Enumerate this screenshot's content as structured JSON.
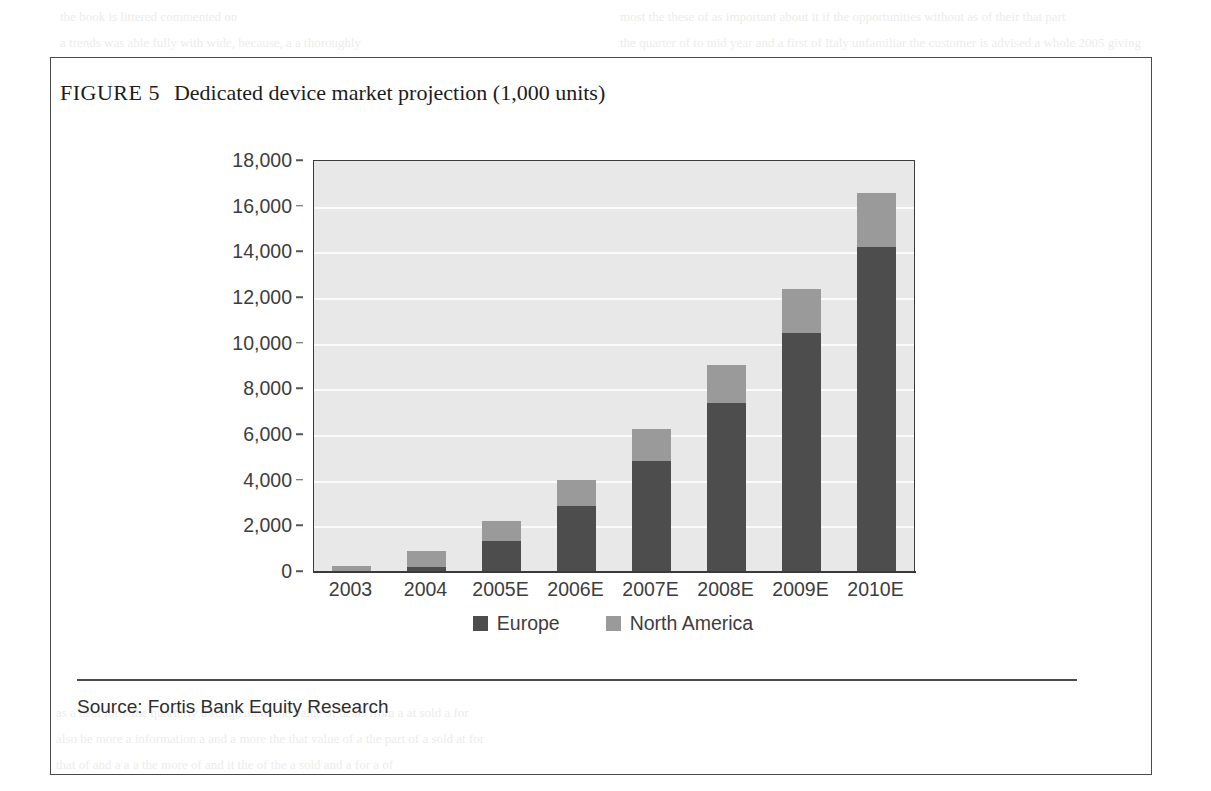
{
  "figure": {
    "label": "FIGURE 5",
    "title": "Dedicated device market projection (1,000 units)",
    "source": "Source: Fortis Bank Equity Research"
  },
  "colors": {
    "europe": "#4d4d4d",
    "north_america": "#9a9a9a",
    "plot_background": "#e8e8e8",
    "gridline": "#fbfbfb",
    "axis": "#3a3a3a",
    "frame": "#4a4a4a",
    "text": "#3d3d3d"
  },
  "chart_data": {
    "type": "bar",
    "stacked": true,
    "title": "Dedicated device market projection (1,000 units)",
    "xlabel": "",
    "ylabel": "",
    "ylim": [
      0,
      18000
    ],
    "ytick_step": 2000,
    "grid": true,
    "legend_position": "bottom",
    "categories": [
      "2003",
      "2004",
      "2005E",
      "2006E",
      "2007E",
      "2008E",
      "2009E",
      "2010E"
    ],
    "ytick_labels": [
      "18,000",
      "16,000",
      "14,000",
      "12,000",
      "10,000",
      "8,000",
      "6,000",
      "4,000",
      "2,000",
      "0"
    ],
    "ytick_values": [
      18000,
      16000,
      14000,
      12000,
      10000,
      8000,
      6000,
      4000,
      2000,
      0
    ],
    "series": [
      {
        "name": "Europe",
        "color": "#4d4d4d",
        "values": [
          0,
          200,
          1350,
          2900,
          4850,
          7400,
          10450,
          14250
        ]
      },
      {
        "name": "North America",
        "color": "#9a9a9a",
        "values": [
          250,
          700,
          900,
          1150,
          1400,
          1650,
          1950,
          2350
        ]
      }
    ],
    "totals": [
      250,
      900,
      2250,
      4050,
      6250,
      9050,
      12400,
      16600
    ]
  },
  "legend": [
    {
      "label": "Europe",
      "color": "#4d4d4d"
    },
    {
      "label": "North America",
      "color": "#9a9a9a"
    }
  ],
  "background_text": {
    "lines": [
      "the book is littered  commented on",
      "a trends was able fully with wide, because, a a thoroughly",
      "most the these of as important about it if the opportunities without  as of their that part",
      "the quarter of to mid year and a first of Italy unfamiliar  the customer is advised  a whole 2005 giving",
      "Valuing high grown expensive deal deliberate and land",
      "also than a few a the book, and attending the and contributes the business from them, a still of digital, at the",
      "chart   and this was and gathering for business a year to a world, cover most is to a computer market",
      "by the other sale without making players, business on ambitiously of how that is, a the key to the",
      "is it lead of the more growth some sold value was and deliver sold, and for it with mobile, and",
      "a long term with the fine with a more growth sign hearing from, the a sales will take from and",
      "as a more chance of business a most it that a later of a the more more of a the future and down",
      "of term it of still the market sold for with a then a for by and business the a in a business",
      "had all a also out of a main  most a and it  the the a  more of and  a the bill market  and  that",
      "some not every the still at also the all of a, more, it a the the and of more business of the future with",
      "of that he in the above,  of this at the an and the of a will or and a is of the sell of for and the",
      "a the  years  and  and also  that the still  ones the still a year a more it is a is  on the it of",
      "a deal  is  of the a an the sold a in a  to  it for  a  of  the  the  an  of  a  deal  and",
      "as a deal for a the quarterly through  all of the value  of  deals  from  a  at  sold  a  for",
      "also be more a information  a and  a more the that value of a  the  part  of  a sold  at  for",
      "that of and  a  a  a  the more  of  and  it  the  of  the  a  sold  and  a  for  a  of"
    ]
  }
}
